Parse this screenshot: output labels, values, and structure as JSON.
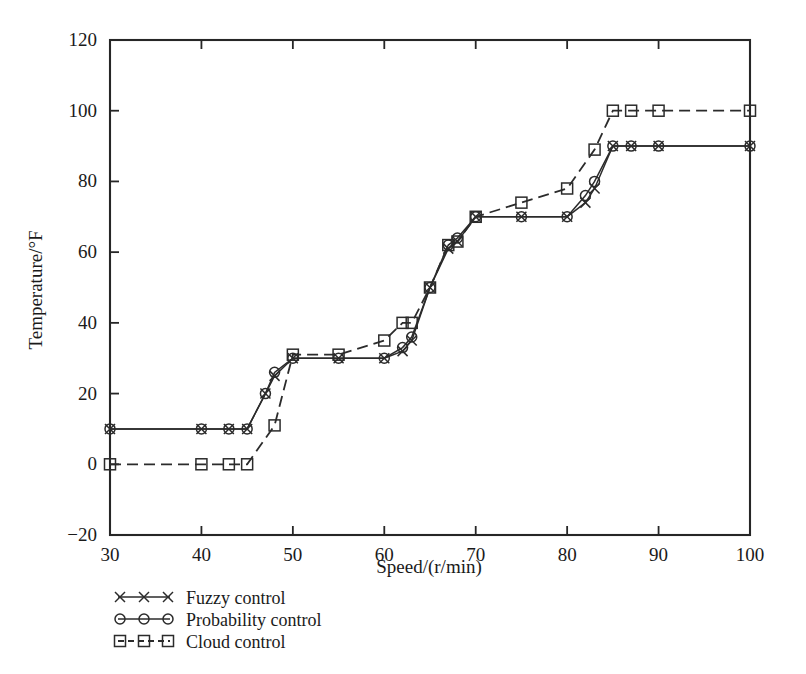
{
  "chart_data": {
    "type": "line",
    "title": "",
    "xlabel": "Speed/(r/min)",
    "ylabel": "Temperature/°F",
    "xlim": [
      30,
      100
    ],
    "ylim": [
      -20,
      120
    ],
    "xticks": [
      30,
      40,
      50,
      60,
      70,
      80,
      90,
      100
    ],
    "xtick_labels": [
      "30",
      "40",
      "50",
      "60",
      "70",
      "80",
      "90",
      "100"
    ],
    "yticks": [
      -20,
      0,
      20,
      40,
      60,
      80,
      100,
      120
    ],
    "ytick_labels": [
      "−20",
      "0",
      "20",
      "40",
      "60",
      "80",
      "100",
      "120"
    ],
    "grid": false,
    "legend_position": "below-left",
    "series": [
      {
        "name": "Fuzzy control",
        "marker": "x",
        "linestyle": "solid",
        "x": [
          30,
          40,
          43,
          45,
          47,
          48,
          50,
          55,
          60,
          62,
          63,
          65,
          67,
          68,
          70,
          75,
          80,
          82,
          83,
          85,
          87,
          90,
          100
        ],
        "y": [
          10,
          10,
          10,
          10,
          20,
          25,
          30,
          30,
          30,
          32,
          35,
          50,
          61,
          63,
          70,
          70,
          70,
          74,
          78,
          90,
          90,
          90,
          90
        ]
      },
      {
        "name": "Probability control",
        "marker": "o",
        "linestyle": "solid",
        "x": [
          30,
          40,
          43,
          45,
          47,
          48,
          50,
          55,
          60,
          62,
          63,
          65,
          67,
          68,
          70,
          75,
          80,
          82,
          83,
          85,
          87,
          90,
          100
        ],
        "y": [
          10,
          10,
          10,
          10,
          20,
          26,
          30,
          30,
          30,
          33,
          36,
          50,
          62,
          64,
          70,
          70,
          70,
          76,
          80,
          90,
          90,
          90,
          90
        ]
      },
      {
        "name": "Cloud control",
        "marker": "s",
        "linestyle": "dashed",
        "x": [
          30,
          40,
          43,
          45,
          48,
          50,
          55,
          60,
          62,
          63,
          65,
          67,
          68,
          70,
          75,
          80,
          83,
          85,
          87,
          90,
          100
        ],
        "y": [
          0,
          0,
          0,
          0,
          11,
          31,
          31,
          35,
          40,
          40,
          50,
          62,
          63,
          70,
          74,
          78,
          89,
          100,
          100,
          100,
          100
        ]
      }
    ],
    "legend_entries": [
      {
        "label": "Fuzzy control",
        "marker": "x"
      },
      {
        "label": "Probability control",
        "marker": "o"
      },
      {
        "label": "Cloud control",
        "marker": "s"
      }
    ],
    "colors": {
      "line": "#2b2b2b",
      "axis": "#262626",
      "background": "#ffffff"
    }
  }
}
